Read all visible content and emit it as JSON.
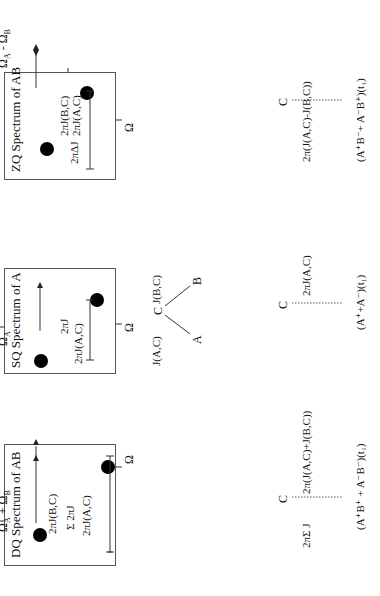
{
  "panels": {
    "dq": {
      "title": "DQ Spectrum of AB",
      "axis_label_top": "Ω",
      "axis_label_top_sub": "A",
      "axis_plus": " + Ω",
      "axis_plus_sub": "B",
      "axis_label_right": "Ω",
      "coupling_top": "2πJ(B,C)",
      "coupling_bottom": "2πJ(A,C)",
      "sum_label": "Σ 2πJ"
    },
    "sq": {
      "title": "SQ Spectrum of A",
      "axis_label_top": "Ω",
      "axis_label_top_sub": "A",
      "axis_label_right": "Ω",
      "coupling": "2πJ(A,C)",
      "j_label": "2πJ"
    },
    "zq": {
      "title": "ZQ Spectrum of AB",
      "axis_label_top": "Ω",
      "axis_label_top_sub": "A",
      "axis_minus": " - Ω",
      "axis_minus_sub": "B",
      "axis_label_right": "Ω",
      "coupling_top": "2πJ(B,C)",
      "coupling_bottom": "2πJ(A,C)",
      "delta_label": "2πΔJ"
    }
  },
  "spin_system": {
    "center": "C",
    "left": "A",
    "right": "B",
    "j_left": "J(A,C)",
    "j_right": "J(B,C)"
  },
  "evolution": {
    "dq": {
      "node": "C",
      "top_label": "2π(J(A,C)+J(B,C))",
      "bottom_label": "2πΣ J",
      "operator": "(A",
      "operator_full": "(A⁺B⁺ + A⁻B⁻)(t₁)"
    },
    "sq": {
      "node": "C",
      "top_label": "2πJ(A,C)",
      "operator_full": "(A⁺+A⁻)(t₁)"
    },
    "zq": {
      "node": "C",
      "top_label": "2π(J(A,C)-J(B,C))",
      "bottom_label": "2πΔ J",
      "operator_full": "(A⁺B⁻+ A⁻B⁺)(t₁)"
    }
  }
}
